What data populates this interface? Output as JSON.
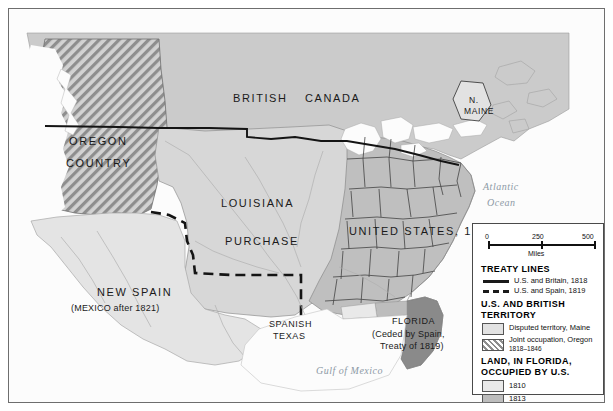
{
  "map": {
    "labels": {
      "oregon_line1": "OREGON",
      "oregon_line2": "COUNTRY",
      "british": "BRITISH",
      "canada": "CANADA",
      "n_maine_line1": "N.",
      "n_maine_line2": "MAINE",
      "louisiana": "LOUISIANA",
      "purchase": "PURCHASE",
      "united_states_1783": "UNITED STATES, 1783",
      "new_spain": "NEW   SPAIN",
      "mexico_after": "(MEXICO after 1821)",
      "spanish": "SPANISH",
      "texas": "TEXAS",
      "florida": "FLORIDA",
      "florida_ceded": "(Ceded by Spain,",
      "florida_treaty": "Treaty of 1819)",
      "atlantic": "Atlantic",
      "ocean": "Ocean",
      "gulf_of_mexico": "Gulf of Mexico"
    }
  },
  "legend": {
    "scale": {
      "start": "0",
      "middle": "250",
      "end": "500",
      "unit": "Miles"
    },
    "sections": [
      {
        "heading": "TREATY LINES",
        "items": [
          {
            "key": "solid-line",
            "label": "U.S. and Britain, 1818"
          },
          {
            "key": "dashed-line",
            "label": "U.S. and Spain, 1819"
          }
        ]
      },
      {
        "heading": "U.S. AND BRITISH TERRITORY",
        "heading_line1": "U.S. AND BRITISH",
        "heading_line2": "TERRITORY",
        "items": [
          {
            "key": "swatch-disputed",
            "label": "Disputed territory, Maine",
            "sub": ""
          },
          {
            "key": "swatch-hatched",
            "label": "Joint occupation, Oregon",
            "sub": "1818–1846"
          }
        ]
      },
      {
        "heading": "LAND, IN FLORIDA, OCCUPIED BY U.S.",
        "heading_line1": "LAND, IN FLORIDA,",
        "heading_line2": "OCCUPIED BY U.S.",
        "items": [
          {
            "key": "swatch-1810",
            "label": "1810"
          },
          {
            "key": "swatch-1813",
            "label": "1813"
          },
          {
            "key": "swatch-1819",
            "label": "1819"
          }
        ]
      }
    ]
  },
  "colors": {
    "land_base": "#c9c9c9",
    "louisiana_purchase": "#d6d6d6",
    "new_spain": "#e3e3e3",
    "united_states": "#bdbdbd",
    "water": "#fbfbfb",
    "ocean_label": "#8d9aa6",
    "fl_1810": "#e9e9e9",
    "fl_1813": "#bdbdbd",
    "fl_1819": "#8a8a8a",
    "border_line": "#4a4a4a",
    "treaty_line": "#1a1a1a"
  }
}
